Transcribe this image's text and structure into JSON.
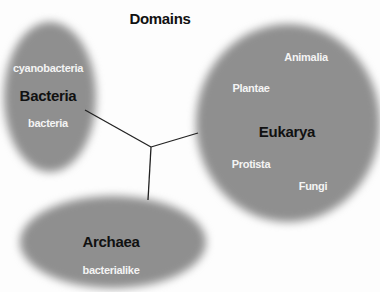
{
  "title": "Domains",
  "domains": [
    {
      "name": "Bacteria",
      "members": [
        "cyanobacteria",
        "bacteria"
      ]
    },
    {
      "name": "Eukarya",
      "members": [
        "Animalia",
        "Plantae",
        "Protista",
        "Fungi"
      ]
    },
    {
      "name": "Archaea",
      "members": [
        "bacterialike"
      ]
    }
  ],
  "colors": {
    "blob": "#8f8f8f",
    "member_text": "#f4f4f4",
    "domain_text": "#111111",
    "line": "#222222"
  }
}
